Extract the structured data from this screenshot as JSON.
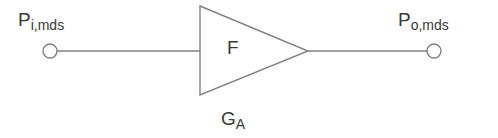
{
  "diagram": {
    "background_color": "#ffffff",
    "stroke_color": "#808080",
    "text_color": "#3a3a3a",
    "input_port": {
      "label_base": "P",
      "label_sub": "i,mds",
      "node_shape": "circle",
      "cx": 50,
      "cy": 51,
      "r": 7
    },
    "output_port": {
      "label_base": "P",
      "label_sub": "o,mds",
      "node_shape": "circle",
      "cx": 434,
      "cy": 51,
      "r": 7
    },
    "amplifier": {
      "shape": "triangle",
      "inner_label": "F",
      "caption_base": "G",
      "caption_sub": "A",
      "points": "200,6 308,51 200,95"
    },
    "wires": [
      {
        "name": "input-wire",
        "x1": 57,
        "y1": 51,
        "x2": 200,
        "y2": 51
      },
      {
        "name": "output-wire",
        "x1": 308,
        "y1": 51,
        "x2": 427,
        "y2": 51
      }
    ]
  }
}
